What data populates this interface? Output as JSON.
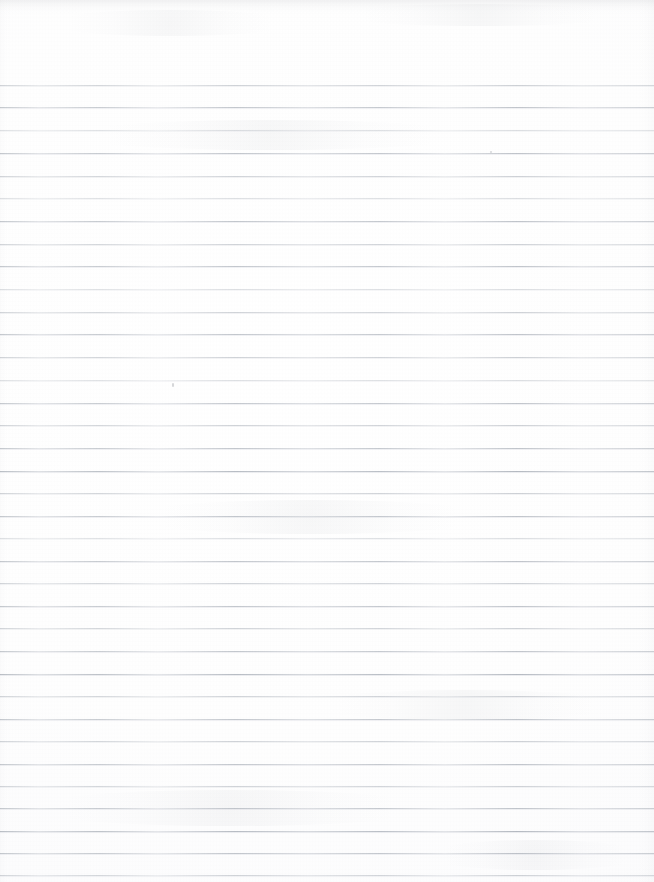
{
  "document": {
    "kind": "scanned-ruled-paper",
    "title": "Blank Lined Notebook Page",
    "description": "Scanned blank sheet of wide-ruled notebook paper, no handwriting or printed text",
    "orientation": "portrait",
    "page_width_px": 654,
    "page_height_px": 882,
    "text_content": "",
    "background_color": "#ffffff",
    "rule_color": "#aab0b8",
    "rule_color_light": "#c6cad1",
    "top_margin_px": 85,
    "rule_spacing_px": 22.5,
    "rule_count": 35,
    "has_vertical_margin_rule": false,
    "has_holes": false
  },
  "rules": [
    {
      "y": 85,
      "weight": "light"
    },
    {
      "y": 107,
      "weight": "medium"
    },
    {
      "y": 130,
      "weight": "faint"
    },
    {
      "y": 153,
      "weight": "medium"
    },
    {
      "y": 176,
      "weight": "light"
    },
    {
      "y": 198,
      "weight": "faint"
    },
    {
      "y": 221,
      "weight": "medium"
    },
    {
      "y": 244,
      "weight": "light"
    },
    {
      "y": 266,
      "weight": "medium"
    },
    {
      "y": 289,
      "weight": "faint"
    },
    {
      "y": 312,
      "weight": "light"
    },
    {
      "y": 334,
      "weight": "medium"
    },
    {
      "y": 357,
      "weight": "light"
    },
    {
      "y": 380,
      "weight": "faint"
    },
    {
      "y": 403,
      "weight": "medium"
    },
    {
      "y": 425,
      "weight": "light"
    },
    {
      "y": 448,
      "weight": "medium"
    },
    {
      "y": 471,
      "weight": "strong"
    },
    {
      "y": 493,
      "weight": "light"
    },
    {
      "y": 516,
      "weight": "medium"
    },
    {
      "y": 538,
      "weight": "faint"
    },
    {
      "y": 561,
      "weight": "medium"
    },
    {
      "y": 583,
      "weight": "light"
    },
    {
      "y": 606,
      "weight": "medium"
    },
    {
      "y": 628,
      "weight": "light"
    },
    {
      "y": 651,
      "weight": "medium"
    },
    {
      "y": 674,
      "weight": "strong"
    },
    {
      "y": 696,
      "weight": "light"
    },
    {
      "y": 719,
      "weight": "medium"
    },
    {
      "y": 741,
      "weight": "light"
    },
    {
      "y": 764,
      "weight": "medium"
    },
    {
      "y": 786,
      "weight": "light"
    },
    {
      "y": 808,
      "weight": "medium"
    },
    {
      "y": 831,
      "weight": "strong"
    },
    {
      "y": 853,
      "weight": "medium"
    },
    {
      "y": 875,
      "weight": "light"
    }
  ],
  "artifacts": {
    "specks": [
      {
        "x": 172,
        "y": 383,
        "w": 2,
        "h": 4
      },
      {
        "x": 490,
        "y": 151,
        "w": 2,
        "h": 2
      },
      {
        "x": 1095,
        "y": 0,
        "w": 0,
        "h": 0
      }
    ],
    "smudges": [
      {
        "x": 40,
        "y": 10,
        "w": 260,
        "h": 26
      },
      {
        "x": 330,
        "y": 4,
        "w": 300,
        "h": 22
      },
      {
        "x": 60,
        "y": 120,
        "w": 420,
        "h": 30
      },
      {
        "x": 120,
        "y": 500,
        "w": 380,
        "h": 34
      },
      {
        "x": 300,
        "y": 690,
        "w": 330,
        "h": 30
      },
      {
        "x": 20,
        "y": 790,
        "w": 420,
        "h": 36
      },
      {
        "x": 420,
        "y": 840,
        "w": 230,
        "h": 30
      }
    ]
  }
}
